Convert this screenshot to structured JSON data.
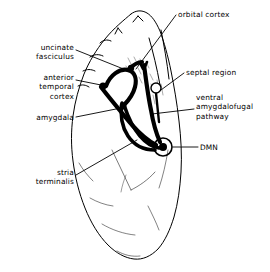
{
  "figure": {
    "type": "anatomical-diagram",
    "background_color": "#ffffff",
    "ink_color": "#000000"
  },
  "labels": {
    "orbital_cortex": "orbital cortex",
    "uncinate_fasciculus": {
      "line1": "uncinate",
      "line2": "fasciculus"
    },
    "anterior_temporal_cortex": {
      "line1": "anterior",
      "line2": "temporal",
      "line3": "cortex"
    },
    "amygdala": "amygdala",
    "stria_terminalis": {
      "line1": "stria",
      "line2": "terminalis"
    },
    "septal_region": "septal region",
    "ventral_amygdalofugal_pathway": {
      "line1": "ventral",
      "line2": "amygdalofugal",
      "line3": "pathway"
    },
    "dmn": "DMN"
  },
  "structures": [
    {
      "name": "amygdala",
      "marker": "filled-dot"
    },
    {
      "name": "septal region",
      "marker": "open-circle"
    },
    {
      "name": "DMN",
      "marker": "filled-dot-in-circle"
    }
  ],
  "pathways": [
    {
      "name": "uncinate fasciculus"
    },
    {
      "name": "stria terminalis"
    },
    {
      "name": "ventral amygdalofugal pathway"
    }
  ]
}
